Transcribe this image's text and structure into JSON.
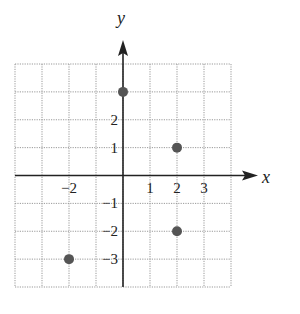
{
  "chart_data": {
    "type": "scatter",
    "title": "",
    "xlabel": "x",
    "ylabel": "y",
    "xlim": [
      -4,
      4
    ],
    "ylim": [
      -4,
      4
    ],
    "grid": true,
    "grid_style": "dotted",
    "x_tick_labels": [
      {
        "value": -2,
        "label": "−2"
      },
      {
        "value": 1,
        "label": "1"
      },
      {
        "value": 2,
        "label": "2"
      },
      {
        "value": 3,
        "label": "3"
      }
    ],
    "y_tick_labels": [
      {
        "value": 2,
        "label": "2"
      },
      {
        "value": 1,
        "label": "1"
      },
      {
        "value": -1,
        "label": "−1"
      },
      {
        "value": -2,
        "label": "−2"
      },
      {
        "value": -3,
        "label": "−3"
      }
    ],
    "points": [
      {
        "x": 0,
        "y": 3
      },
      {
        "x": 2,
        "y": 1
      },
      {
        "x": 2,
        "y": -2
      },
      {
        "x": -2,
        "y": -3
      }
    ],
    "point_color": "#555555",
    "axis_color": "#222222",
    "grid_color": "#999999"
  }
}
